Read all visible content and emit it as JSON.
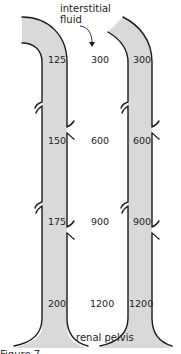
{
  "diagram": {
    "annotations": {
      "top": [
        "interstitial",
        "fluid"
      ],
      "bottom": "renal pelvis"
    },
    "left_tube": {
      "name": "ascending/descending limb (tubular fluid)",
      "values": [
        "125",
        "150",
        "175",
        "200"
      ]
    },
    "interstitial_column": {
      "values": [
        "300",
        "600",
        "900",
        "1200"
      ]
    },
    "right_tube": {
      "name": "collecting duct",
      "values": [
        "300",
        "600",
        "900",
        "1200"
      ]
    },
    "colors": {
      "tube_fill": "#d9d9d9",
      "wall_stroke": "#1a1a1a",
      "text": "#222222"
    },
    "caption_partial": "Figure 7 ..."
  }
}
